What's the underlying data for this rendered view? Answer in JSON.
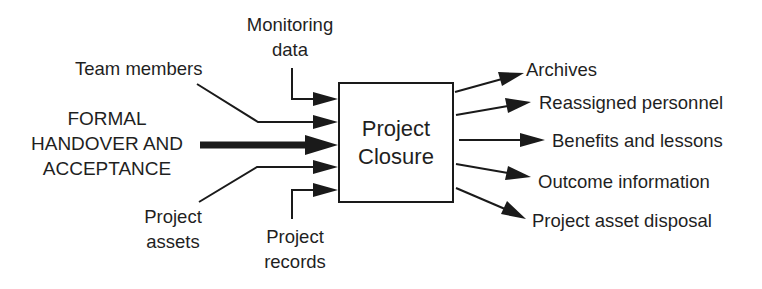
{
  "diagram": {
    "title": "Project Closure",
    "process": {
      "line1": "Project",
      "line2": "Closure"
    },
    "inputs": {
      "monitoring": {
        "line1": "Monitoring",
        "line2": "data"
      },
      "team": {
        "label": "Team members"
      },
      "formal": {
        "line1": "FORMAL",
        "line2": "HANDOVER AND",
        "line3": "ACCEPTANCE"
      },
      "assets": {
        "line1": "Project",
        "line2": "assets"
      },
      "records": {
        "line1": "Project",
        "line2": "records"
      }
    },
    "outputs": [
      {
        "label": "Archives"
      },
      {
        "label": "Reassigned personnel"
      },
      {
        "label": "Benefits and lessons"
      },
      {
        "label": "Outcome information"
      },
      {
        "label": "Project asset disposal"
      }
    ],
    "colors": {
      "ink": "#1a1a1a",
      "background": "#ffffff"
    }
  }
}
